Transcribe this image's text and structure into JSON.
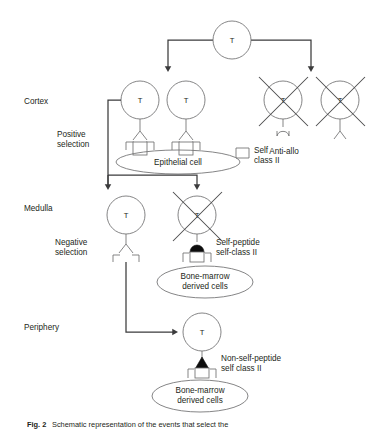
{
  "figure": {
    "title_label": "T-cell repertoire selection schematic",
    "caption_prefix": "Fig. 2",
    "caption_text": "Schematic representation of the events that select the",
    "cell_letter": "T"
  },
  "stages": [
    {
      "key": "cortex",
      "label": "Cortex",
      "x": 24,
      "y": 101
    },
    {
      "key": "medulla",
      "label": "Medulla",
      "x": 24,
      "y": 208
    },
    {
      "key": "periphery",
      "label": "Periphery",
      "x": 24,
      "y": 327
    }
  ],
  "processes": [
    {
      "key": "positive",
      "line1": "Positive",
      "line2": "selection",
      "x": 57,
      "y": 137
    },
    {
      "key": "negative",
      "line1": "Negative",
      "line2": "selection",
      "x": 55,
      "y": 245
    }
  ],
  "annotations": {
    "epithelial_cell": "Epithelial cell",
    "self_class_ii_line1": "Self",
    "self_class_ii_line2": "class II",
    "anti_allo": "Anti-allo",
    "self_peptide_line1": "Self-peptide",
    "self_peptide_line2": "self-class II",
    "nonself_peptide_line1": "Non-self-peptide",
    "nonself_peptide_line2": "self class II",
    "bone_marrow_line1": "Bone-marrow",
    "bone_marrow_line2": "derived cells"
  },
  "cells": [
    {
      "key": "progenitor",
      "letter": "T",
      "cx": 232,
      "cy": 40,
      "r": 19,
      "crossed": false,
      "region": "thymus-entry"
    },
    {
      "key": "cortex-selected",
      "letter": "T",
      "cx": 140,
      "cy": 100,
      "r": 19,
      "crossed": false,
      "region": "cortex"
    },
    {
      "key": "cortex-bystander",
      "letter": "T",
      "cx": 186,
      "cy": 100,
      "r": 19,
      "crossed": false,
      "region": "cortex"
    },
    {
      "key": "anti-allo-left",
      "letter": "T",
      "cx": 283,
      "cy": 100,
      "r": 19,
      "crossed": true,
      "region": "cortex"
    },
    {
      "key": "anti-allo-right",
      "letter": "T",
      "cx": 340,
      "cy": 100,
      "r": 19,
      "crossed": true,
      "region": "cortex"
    },
    {
      "key": "medulla-surviving",
      "letter": "T",
      "cx": 126,
      "cy": 215,
      "r": 19,
      "crossed": false,
      "region": "medulla"
    },
    {
      "key": "medulla-deleted",
      "letter": "T",
      "cx": 197,
      "cy": 215,
      "r": 19,
      "crossed": true,
      "region": "medulla"
    },
    {
      "key": "periphery-mature",
      "letter": "T",
      "cx": 202,
      "cy": 332,
      "r": 19,
      "crossed": false,
      "region": "periphery"
    }
  ],
  "presenting_cells": [
    {
      "key": "epithelial-cell",
      "cx": 178,
      "cy": 162,
      "rx": 62,
      "ry": 12,
      "label_key": "epithelial_cell"
    },
    {
      "key": "bone-marrow-medulla",
      "cx": 205,
      "cy": 282,
      "rx": 48,
      "ry": 16,
      "label_key": "bone_marrow"
    },
    {
      "key": "bone-marrow-periphery",
      "cx": 200,
      "cy": 396,
      "rx": 48,
      "ry": 16,
      "label_key": "bone_marrow"
    }
  ],
  "peptides": [
    {
      "key": "self-peptide",
      "shape": "dome",
      "filled": true
    },
    {
      "key": "non-self-peptide",
      "shape": "triangle",
      "filled": true
    }
  ],
  "colors": {
    "background": "#ffffff",
    "outline": "#6f6f70",
    "arrow": "#3b3b3c",
    "cross": "#4a4a4b",
    "text": "#231f20",
    "peptide_fill": "#0d0d0d"
  }
}
